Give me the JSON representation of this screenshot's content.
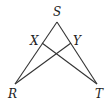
{
  "diagram": {
    "type": "geometry",
    "points": {
      "S": {
        "label": "S",
        "x": 57,
        "y": 22,
        "lx": 53,
        "ly": 16
      },
      "X": {
        "label": "X",
        "x": 42,
        "y": 43,
        "lx": 30,
        "ly": 45
      },
      "Y": {
        "label": "Y",
        "x": 71,
        "y": 43,
        "lx": 73,
        "ly": 45
      },
      "R": {
        "label": "R",
        "x": 15,
        "y": 84,
        "lx": 8,
        "ly": 98
      },
      "T": {
        "label": "T",
        "x": 97,
        "y": 84,
        "lx": 95,
        "ly": 98
      }
    },
    "segments": [
      {
        "from": "S",
        "to": "R"
      },
      {
        "from": "S",
        "to": "T"
      },
      {
        "from": "X",
        "to": "T"
      },
      {
        "from": "Y",
        "to": "R"
      }
    ]
  }
}
